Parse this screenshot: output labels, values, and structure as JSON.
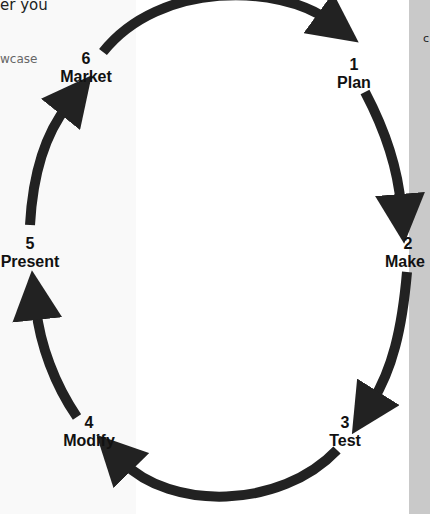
{
  "page_fragments": {
    "left_top": "er you",
    "left_mid": "wcase",
    "right_top": "c"
  },
  "diagram": {
    "type": "cycle",
    "arrow_color": "#222222",
    "steps": [
      {
        "number": "1",
        "label": "Plan"
      },
      {
        "number": "2",
        "label": "Make"
      },
      {
        "number": "3",
        "label": "Test"
      },
      {
        "number": "4",
        "label": "Modify"
      },
      {
        "number": "5",
        "label": "Present"
      },
      {
        "number": "6",
        "label": "Market"
      }
    ]
  },
  "colors": {
    "left_panel": "#f9f9f9",
    "right_strip": "#c9c9c9",
    "background": "#ffffff"
  }
}
